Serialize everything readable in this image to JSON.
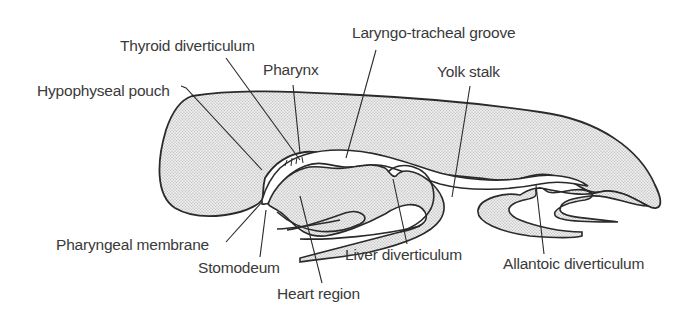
{
  "diagram": {
    "labels": {
      "thyroid_diverticulum": "Thyroid diverticulum",
      "laryngo_tracheal_groove": "Laryngo-tracheal groove",
      "pharynx": "Pharynx",
      "yolk_stalk": "Yolk stalk",
      "hypophyseal_pouch": "Hypophyseal pouch",
      "pharyngeal_membrane": "Pharyngeal membrane",
      "stomodeum": "Stomodeum",
      "liver_diverticulum": "Liver diverticulum",
      "allantoic_diverticulum": "Allantoic diverticulum",
      "heart_region": "Heart region"
    },
    "colors": {
      "outline": "#2a2a2a",
      "fill_stipple": "#d9d9d9",
      "text": "#3a3a3a",
      "background": "#ffffff"
    }
  }
}
